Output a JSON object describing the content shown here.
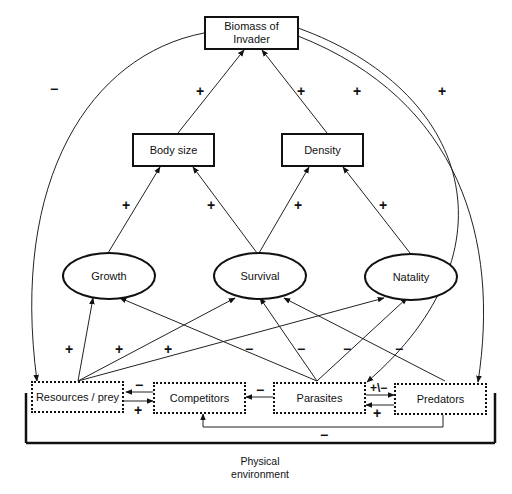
{
  "nodes": {
    "biomass": "Biomass of\nInvader",
    "biomass_line1": "Biomass of",
    "biomass_line2": "Invader",
    "body_size": "Body size",
    "density": "Density",
    "growth": "Growth",
    "survival": "Survival",
    "natality": "Natality",
    "resources": "Resources / prey",
    "competitors": "Competitors",
    "parasites": "Parasites",
    "predators": "Predators",
    "environment_line1": "Physical",
    "environment_line2": "environment"
  },
  "signs": {
    "biomass_to_resources": "−",
    "bodysize_to_biomass": "+",
    "density_to_biomass": "+",
    "biomass_to_parasites": "+",
    "biomass_to_predators": "+",
    "growth_to_bodysize": "+",
    "survival_to_bodysize": "+",
    "survival_to_density": "+",
    "natality_to_density": "+",
    "resources_to_growth": "+",
    "resources_to_survival": "+",
    "resources_to_natality": "+",
    "parasites_to_growth": "−",
    "parasites_to_survival": "−",
    "predators_to_survival": "−",
    "parasites_to_natality": "−",
    "competitors_to_resources": "−",
    "resources_to_competitors": "+",
    "parasites_to_competitors": "−",
    "parasites_predators": "+\\−",
    "predators_to_parasites": "+",
    "predators_to_competitors": "−"
  },
  "edges": [
    {
      "from": "Body size",
      "to": "Biomass of Invader",
      "sign": "+"
    },
    {
      "from": "Density",
      "to": "Biomass of Invader",
      "sign": "+"
    },
    {
      "from": "Growth",
      "to": "Body size",
      "sign": "+"
    },
    {
      "from": "Survival",
      "to": "Body size",
      "sign": "+"
    },
    {
      "from": "Survival",
      "to": "Density",
      "sign": "+"
    },
    {
      "from": "Natality",
      "to": "Density",
      "sign": "+"
    },
    {
      "from": "Resources / prey",
      "to": "Growth",
      "sign": "+"
    },
    {
      "from": "Resources / prey",
      "to": "Survival",
      "sign": "+"
    },
    {
      "from": "Resources / prey",
      "to": "Natality",
      "sign": "+"
    },
    {
      "from": "Parasites",
      "to": "Growth",
      "sign": "−"
    },
    {
      "from": "Parasites",
      "to": "Survival",
      "sign": "−"
    },
    {
      "from": "Parasites",
      "to": "Natality",
      "sign": "−"
    },
    {
      "from": "Predators",
      "to": "Survival",
      "sign": "−"
    },
    {
      "from": "Biomass of Invader",
      "to": "Resources / prey",
      "sign": "−"
    },
    {
      "from": "Biomass of Invader",
      "to": "Parasites",
      "sign": "+"
    },
    {
      "from": "Biomass of Invader",
      "to": "Predators",
      "sign": "+"
    },
    {
      "from": "Competitors",
      "to": "Resources / prey",
      "sign": "−"
    },
    {
      "from": "Resources / prey",
      "to": "Competitors",
      "sign": "+"
    },
    {
      "from": "Parasites",
      "to": "Competitors",
      "sign": "−"
    },
    {
      "from": "Parasites",
      "to": "Predators",
      "sign": "+\\−"
    },
    {
      "from": "Predators",
      "to": "Parasites",
      "sign": "+"
    },
    {
      "from": "Predators",
      "to": "Competitors",
      "sign": "−"
    }
  ]
}
